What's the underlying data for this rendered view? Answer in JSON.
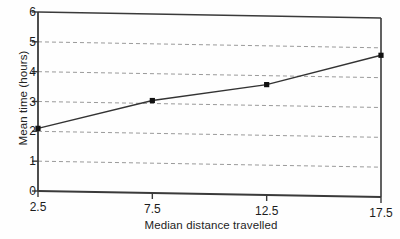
{
  "chart_data": {
    "type": "line",
    "title": "",
    "subtitle": "",
    "xlabel": "Median distance travelled",
    "ylabel": "Mean time (hours)",
    "x": [
      2.5,
      7.5,
      12.5,
      17.5
    ],
    "values": [
      2.1,
      3.1,
      3.7,
      4.75
    ],
    "series": [
      {
        "name": "Mean time",
        "x": [
          2.5,
          7.5,
          12.5,
          17.5
        ],
        "values": [
          2.1,
          3.1,
          3.7,
          4.75
        ],
        "marker": "filled-square",
        "color": "#333333"
      }
    ],
    "xlim": [
      2.5,
      17.5
    ],
    "ylim": [
      0,
      6
    ],
    "xticks": [
      2.5,
      7.5,
      12.5,
      17.5
    ],
    "xtick_labels": [
      "2.5",
      "7.5",
      "12.5",
      "17.5"
    ],
    "yticks": [
      0,
      1,
      2,
      3,
      4,
      5,
      6
    ],
    "ytick_labels": [
      "0",
      "1",
      "2",
      "3",
      "4",
      "5",
      "6"
    ],
    "grid": {
      "horizontal": true,
      "vertical": false,
      "style": "dashed",
      "at": [
        1,
        2,
        3,
        4,
        5
      ],
      "color": "#999999"
    },
    "legend": null,
    "annotations": [],
    "frame": "box",
    "colors": {
      "line": "#333333",
      "marker": "#111111",
      "axis": "#3a3a3a",
      "grid": "#9a9a9a",
      "background": "#fefefe"
    }
  }
}
